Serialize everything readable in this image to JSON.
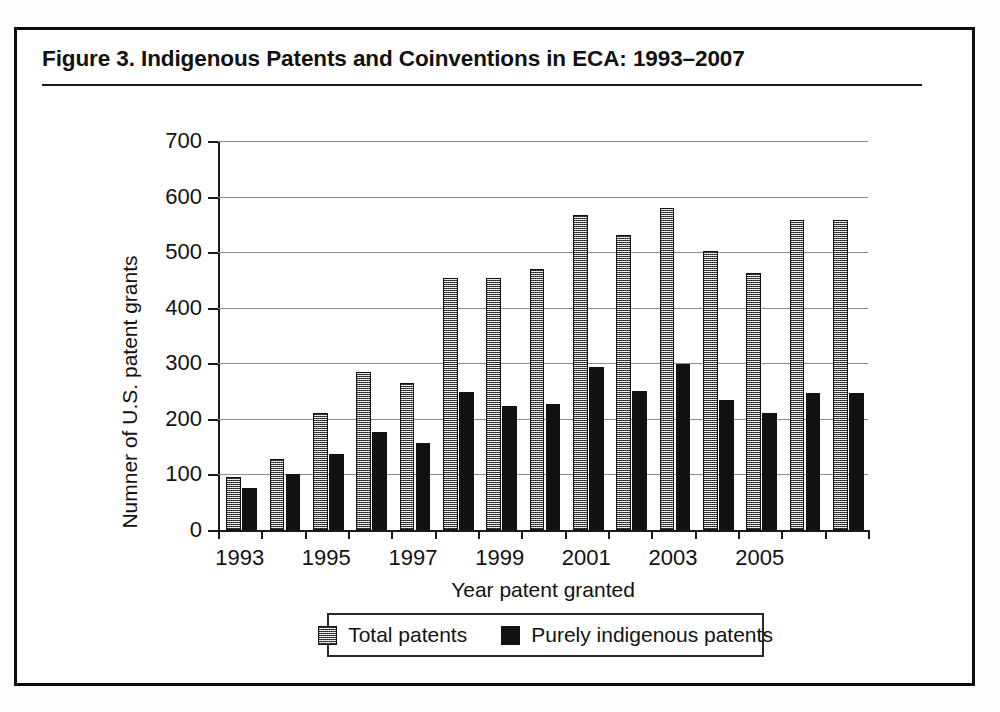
{
  "figure": {
    "title": "Figure 3.  Indigenous Patents and Coinventions in ECA: 1993–2007"
  },
  "legend": {
    "items": [
      {
        "label": "Total patents",
        "swatch": "gray-hatched-swatch",
        "color": "#9a9a9a"
      },
      {
        "label": "Purely indigenous patents",
        "swatch": "black-swatch",
        "color": "#111111"
      }
    ]
  },
  "axes": {
    "y_title": "Numner of U.S. patent grants",
    "x_title": "Year patent granted",
    "y_ticks": [
      "0",
      "100",
      "200",
      "300",
      "400",
      "500",
      "600",
      "700"
    ],
    "x_ticks_labeled": [
      "1993",
      "1995",
      "1997",
      "1999",
      "2001",
      "2003",
      "2005"
    ]
  },
  "chart_data": {
    "type": "bar",
    "title": "Figure 3.  Indigenous Patents and Coinventions in ECA: 1993–2007",
    "xlabel": "Year patent granted",
    "ylabel": "Numner of U.S. patent grants",
    "ylim": [
      0,
      700
    ],
    "ytick_step": 100,
    "grid": true,
    "legend_position": "bottom",
    "categories": [
      "1993",
      "1994",
      "1995",
      "1996",
      "1997",
      "1998",
      "1999",
      "2000",
      "2001",
      "2002",
      "2003",
      "2004",
      "2005",
      "2006",
      "2007"
    ],
    "series": [
      {
        "name": "Total patents",
        "color": "#9a9a9a",
        "values": [
          96,
          128,
          210,
          285,
          264,
          453,
          454,
          470,
          567,
          530,
          580,
          502,
          463,
          558,
          558
        ]
      },
      {
        "name": "Purely indigenous patents",
        "color": "#111111",
        "values": [
          75,
          101,
          136,
          176,
          157,
          248,
          224,
          227,
          293,
          251,
          298,
          234,
          210,
          246,
          246
        ]
      }
    ]
  }
}
